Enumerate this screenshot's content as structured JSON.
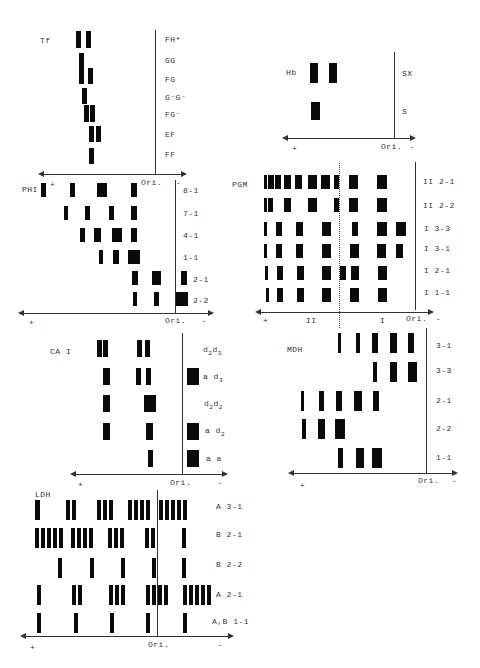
{
  "panels": {
    "tf": {
      "title": "Tf",
      "rows": [
        "FH*",
        "GG",
        "FG",
        "G⁻G⁻",
        "FG⁻",
        "EF",
        "FF"
      ],
      "axis": {
        "plus": "+",
        "origin": "Ori.",
        "minus": "-"
      }
    },
    "hb": {
      "title": "Hb",
      "rows": [
        "SX",
        "S"
      ],
      "axis": {
        "plus": "+",
        "origin": "Ori.",
        "minus": "-"
      }
    },
    "phi": {
      "title": "PHI",
      "rows": [
        "8-1",
        "7-1",
        "4-1",
        "1-1",
        "2-1",
        "2-2"
      ],
      "axis": {
        "plus": "+",
        "origin": "Ori.",
        "minus": "-"
      }
    },
    "pgm": {
      "title": "PGM",
      "rows": [
        "II 2-1",
        "II 2-2",
        "I  3-3",
        "I  3-1",
        "I  2-1",
        "I  1-1"
      ],
      "axis": {
        "plus": "+",
        "zone2": "II",
        "zone1": "I",
        "origin": "Ori.",
        "minus": "-"
      }
    },
    "ca1": {
      "title": "CA I",
      "rows": [
        "d2d3",
        "a d3",
        "d2d2",
        "a d2",
        "a a"
      ],
      "axis": {
        "plus": "+",
        "origin": "Ori.",
        "minus": "-"
      }
    },
    "mdh": {
      "title": "MDH",
      "rows": [
        "3-1",
        "3-3",
        "2-1",
        "2-2",
        "1-1"
      ],
      "axis": {
        "plus": "+",
        "origin": "Ori.",
        "minus": "-"
      }
    },
    "ldh": {
      "title": "LDH",
      "rows": [
        "A 3-1",
        "B 2-1",
        "B 2-2",
        "A 2-1",
        "A,B 1-1"
      ],
      "axis": {
        "plus": "+",
        "origin": "Ori.",
        "minus": "-"
      }
    }
  },
  "bands": {
    "tf": [
      [
        76,
        31,
        5,
        17
      ],
      [
        86,
        31,
        5,
        17
      ],
      [
        79,
        53,
        5,
        15
      ],
      [
        79,
        68,
        5,
        16
      ],
      [
        88,
        68,
        5,
        16
      ],
      [
        82,
        88,
        5,
        16
      ],
      [
        84,
        105,
        5,
        17
      ],
      [
        90,
        105,
        5,
        17
      ],
      [
        89,
        126,
        5,
        16
      ],
      [
        96,
        126,
        5,
        16
      ],
      [
        89,
        148,
        5,
        16
      ]
    ],
    "hb": [
      [
        310,
        63,
        8,
        20
      ],
      [
        329,
        63,
        8,
        20
      ],
      [
        311,
        102,
        9,
        18
      ]
    ],
    "phi": [
      [
        41,
        183,
        5,
        14
      ],
      [
        70,
        183,
        5,
        14
      ],
      [
        97,
        183,
        10,
        14
      ],
      [
        131,
        183,
        6,
        14
      ],
      [
        64,
        206,
        4,
        14
      ],
      [
        85,
        206,
        5,
        14
      ],
      [
        109,
        206,
        5,
        14
      ],
      [
        131,
        206,
        6,
        14
      ],
      [
        80,
        228,
        5,
        14
      ],
      [
        94,
        228,
        7,
        14
      ],
      [
        112,
        228,
        10,
        14
      ],
      [
        131,
        228,
        6,
        14
      ],
      [
        99,
        250,
        4,
        14
      ],
      [
        113,
        250,
        6,
        14
      ],
      [
        128,
        250,
        12,
        14
      ],
      [
        132,
        271,
        6,
        14
      ],
      [
        152,
        271,
        9,
        14
      ],
      [
        181,
        271,
        6,
        14
      ],
      [
        133,
        292,
        4,
        14
      ],
      [
        154,
        292,
        5,
        14
      ],
      [
        176,
        292,
        12,
        14
      ]
    ],
    "pgm": [
      [
        264,
        175,
        3,
        14
      ],
      [
        268,
        175,
        6,
        14
      ],
      [
        275,
        175,
        6,
        14
      ],
      [
        284,
        175,
        7,
        14
      ],
      [
        295,
        175,
        7,
        14
      ],
      [
        308,
        175,
        9,
        14
      ],
      [
        321,
        175,
        9,
        14
      ],
      [
        334,
        175,
        5,
        14
      ],
      [
        349,
        175,
        9,
        14
      ],
      [
        377,
        175,
        10,
        14
      ],
      [
        264,
        198,
        3,
        14
      ],
      [
        268,
        198,
        5,
        14
      ],
      [
        284,
        198,
        7,
        14
      ],
      [
        308,
        198,
        9,
        14
      ],
      [
        334,
        198,
        5,
        14
      ],
      [
        349,
        198,
        9,
        14
      ],
      [
        377,
        198,
        10,
        14
      ],
      [
        264,
        222,
        3,
        14
      ],
      [
        276,
        222,
        6,
        14
      ],
      [
        296,
        222,
        7,
        14
      ],
      [
        322,
        222,
        9,
        14
      ],
      [
        352,
        222,
        6,
        14
      ],
      [
        377,
        222,
        10,
        14
      ],
      [
        396,
        222,
        10,
        14
      ],
      [
        264,
        244,
        3,
        14
      ],
      [
        276,
        244,
        6,
        14
      ],
      [
        296,
        244,
        7,
        14
      ],
      [
        322,
        244,
        9,
        14
      ],
      [
        350,
        244,
        9,
        14
      ],
      [
        377,
        244,
        9,
        14
      ],
      [
        396,
        244,
        7,
        14
      ],
      [
        265,
        266,
        3,
        14
      ],
      [
        277,
        266,
        6,
        14
      ],
      [
        297,
        266,
        7,
        14
      ],
      [
        322,
        266,
        9,
        14
      ],
      [
        340,
        266,
        6,
        14
      ],
      [
        351,
        266,
        8,
        14
      ],
      [
        378,
        266,
        9,
        14
      ],
      [
        266,
        288,
        3,
        14
      ],
      [
        277,
        288,
        6,
        14
      ],
      [
        297,
        288,
        7,
        14
      ],
      [
        322,
        288,
        9,
        14
      ],
      [
        350,
        288,
        9,
        14
      ],
      [
        378,
        288,
        9,
        14
      ]
    ],
    "ca1": [
      [
        97,
        340,
        5,
        17
      ],
      [
        103,
        340,
        5,
        17
      ],
      [
        137,
        340,
        5,
        17
      ],
      [
        145,
        340,
        5,
        17
      ],
      [
        103,
        368,
        7,
        17
      ],
      [
        136,
        368,
        5,
        17
      ],
      [
        146,
        368,
        5,
        17
      ],
      [
        187,
        368,
        12,
        17
      ],
      [
        103,
        395,
        7,
        17
      ],
      [
        144,
        395,
        12,
        17
      ],
      [
        103,
        423,
        7,
        17
      ],
      [
        146,
        423,
        7,
        17
      ],
      [
        187,
        423,
        12,
        17
      ],
      [
        148,
        450,
        5,
        17
      ],
      [
        187,
        450,
        12,
        17
      ]
    ],
    "mdh": [
      [
        338,
        333,
        3,
        20
      ],
      [
        356,
        333,
        4,
        20
      ],
      [
        372,
        333,
        6,
        20
      ],
      [
        390,
        333,
        7,
        20
      ],
      [
        408,
        333,
        6,
        20
      ],
      [
        373,
        362,
        4,
        20
      ],
      [
        390,
        362,
        7,
        20
      ],
      [
        408,
        362,
        9,
        20
      ],
      [
        301,
        391,
        3,
        20
      ],
      [
        319,
        391,
        5,
        20
      ],
      [
        336,
        391,
        6,
        20
      ],
      [
        354,
        391,
        8,
        20
      ],
      [
        373,
        391,
        6,
        20
      ],
      [
        302,
        419,
        4,
        20
      ],
      [
        318,
        419,
        7,
        20
      ],
      [
        335,
        419,
        10,
        20
      ],
      [
        338,
        448,
        5,
        20
      ],
      [
        356,
        448,
        8,
        20
      ],
      [
        372,
        448,
        10,
        20
      ]
    ],
    "ldh": [
      [
        35,
        500,
        5,
        20
      ],
      [
        66,
        500,
        4,
        20
      ],
      [
        72,
        500,
        4,
        20
      ],
      [
        97,
        500,
        4,
        20
      ],
      [
        103,
        500,
        4,
        20
      ],
      [
        109,
        500,
        4,
        20
      ],
      [
        128,
        500,
        4,
        20
      ],
      [
        134,
        500,
        4,
        20
      ],
      [
        140,
        500,
        4,
        20
      ],
      [
        146,
        500,
        4,
        20
      ],
      [
        159,
        500,
        4,
        20
      ],
      [
        165,
        500,
        4,
        20
      ],
      [
        171,
        500,
        4,
        20
      ],
      [
        177,
        500,
        4,
        20
      ],
      [
        183,
        500,
        4,
        20
      ],
      [
        35,
        528,
        4,
        20
      ],
      [
        41,
        528,
        4,
        20
      ],
      [
        47,
        528,
        4,
        20
      ],
      [
        53,
        528,
        4,
        20
      ],
      [
        59,
        528,
        4,
        20
      ],
      [
        71,
        528,
        4,
        20
      ],
      [
        77,
        528,
        4,
        20
      ],
      [
        83,
        528,
        4,
        20
      ],
      [
        89,
        528,
        4,
        20
      ],
      [
        108,
        528,
        4,
        20
      ],
      [
        114,
        528,
        4,
        20
      ],
      [
        120,
        528,
        4,
        20
      ],
      [
        145,
        528,
        4,
        20
      ],
      [
        151,
        528,
        4,
        20
      ],
      [
        182,
        528,
        4,
        20
      ],
      [
        58,
        558,
        4,
        20
      ],
      [
        90,
        558,
        4,
        20
      ],
      [
        121,
        558,
        4,
        20
      ],
      [
        152,
        558,
        4,
        20
      ],
      [
        182,
        558,
        4,
        20
      ],
      [
        37,
        585,
        4,
        20
      ],
      [
        72,
        585,
        4,
        20
      ],
      [
        78,
        585,
        4,
        20
      ],
      [
        109,
        585,
        4,
        20
      ],
      [
        115,
        585,
        4,
        20
      ],
      [
        121,
        585,
        4,
        20
      ],
      [
        146,
        585,
        4,
        20
      ],
      [
        152,
        585,
        4,
        20
      ],
      [
        158,
        585,
        4,
        20
      ],
      [
        164,
        585,
        4,
        20
      ],
      [
        183,
        585,
        4,
        20
      ],
      [
        189,
        585,
        4,
        20
      ],
      [
        195,
        585,
        4,
        20
      ],
      [
        201,
        585,
        4,
        20
      ],
      [
        207,
        585,
        4,
        20
      ],
      [
        37,
        613,
        4,
        20
      ],
      [
        74,
        613,
        4,
        20
      ],
      [
        110,
        613,
        4,
        20
      ],
      [
        146,
        613,
        4,
        20
      ],
      [
        183,
        613,
        4,
        20
      ]
    ]
  }
}
